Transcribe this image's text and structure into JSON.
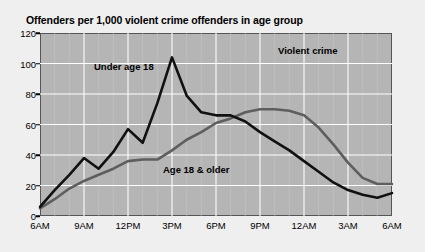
{
  "chart_data": {
    "type": "line",
    "title": "Offenders per 1,000 violent crime offenders in age group",
    "subtitle": "",
    "xlabel": "",
    "ylabel": "",
    "ylim": [
      0,
      120
    ],
    "ytick_step": 20,
    "yticks": [
      "0",
      "20",
      "40",
      "60",
      "80",
      "100",
      "120"
    ],
    "xticks": [
      "6AM",
      "9AM",
      "12PM",
      "3PM",
      "6PM",
      "9PM",
      "12AM",
      "3AM",
      "6AM"
    ],
    "xlim_hours": [
      0,
      24
    ],
    "grid": true,
    "grid_minor_hourly": true,
    "legend": "inline-annotations",
    "annotations": [
      {
        "id": "violent-crime",
        "text": "Violent crime"
      },
      {
        "id": "under-18",
        "text": "Under age 18"
      },
      {
        "id": "adult",
        "text": "Age 18 & older"
      }
    ],
    "x": [
      "6AM",
      "7AM",
      "8AM",
      "9AM",
      "10AM",
      "11AM",
      "12PM",
      "1PM",
      "2PM",
      "3PM",
      "4PM",
      "5PM",
      "6PM",
      "7PM",
      "8PM",
      "9PM",
      "10PM",
      "11PM",
      "12AM",
      "1AM",
      "2AM",
      "3AM",
      "4AM",
      "5AM",
      "6AM"
    ],
    "series": [
      {
        "name": "Under age 18",
        "color": "#111111",
        "values": [
          6,
          17,
          27,
          38,
          31,
          42,
          57,
          48,
          74,
          104,
          79,
          68,
          66,
          66,
          62,
          55,
          49,
          43,
          36,
          29,
          22,
          17,
          14,
          12,
          15
        ]
      },
      {
        "name": "Age 18 & older",
        "color": "#5e5e5e",
        "values": [
          5,
          11,
          18,
          23,
          27,
          31,
          36,
          37,
          37,
          43,
          50,
          55,
          61,
          64,
          68,
          70,
          70,
          69,
          66,
          58,
          47,
          35,
          25,
          21,
          21
        ]
      }
    ]
  },
  "colors": {
    "page_background": "#efefef",
    "plot_background": "#b5b5b5",
    "plot_border": "#555555",
    "gridline_major": "#ffffff",
    "gridline_minor": "#c9c9c9",
    "series_youth": "#111111",
    "series_adult": "#5e5e5e",
    "text": "#000000"
  }
}
